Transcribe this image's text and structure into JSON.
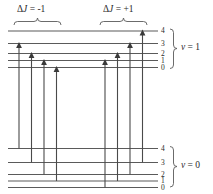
{
  "figure": {
    "background_color": "#ffffff",
    "line_color": "#5a5a5a",
    "text_color": "#2a2a2a",
    "width": 213,
    "height": 194
  },
  "branch_labels": {
    "left": {
      "delta": "Δ",
      "j": "J",
      "equals_value": " = -1",
      "full": "ΔJ = -1"
    },
    "right": {
      "delta": "Δ",
      "j": "J",
      "equals_value": " = +1",
      "full": "ΔJ = +1"
    }
  },
  "manifolds": [
    {
      "name": "upper",
      "v_symbol": "ν",
      "v_equals": " = 1",
      "v_full": "ν = 1",
      "j_labels": [
        "4",
        "3",
        "2",
        "1",
        "0"
      ],
      "level_y": [
        31,
        43.5,
        53.5,
        60.5,
        67.5
      ]
    },
    {
      "name": "lower",
      "v_symbol": "ν",
      "v_equals": " = 0",
      "v_full": "ν = 0",
      "j_labels": [
        "4",
        "3",
        "2",
        "1",
        "0"
      ],
      "level_y": [
        148.5,
        162.5,
        174.5,
        181,
        187.5
      ]
    }
  ],
  "transitions": {
    "left_branch": [
      {
        "x": 19,
        "from_level": "4",
        "to_level": "3",
        "y_start": 148.5,
        "y_end": 43.5
      },
      {
        "x": 31.5,
        "from_level": "3",
        "to_level": "2",
        "y_start": 162.5,
        "y_end": 53.5
      },
      {
        "x": 44,
        "from_level": "2",
        "to_level": "1",
        "y_start": 174.5,
        "y_end": 60.5
      },
      {
        "x": 56.5,
        "from_level": "1",
        "to_level": "0",
        "y_start": 181,
        "y_end": 67.5
      }
    ],
    "right_branch": [
      {
        "x": 105,
        "from_level": "0",
        "to_level": "1",
        "y_start": 187.5,
        "y_end": 60.5
      },
      {
        "x": 117.5,
        "from_level": "1",
        "to_level": "2",
        "y_start": 181,
        "y_end": 53.5
      },
      {
        "x": 130,
        "from_level": "2",
        "to_level": "3",
        "y_start": 174.5,
        "y_end": 43.5
      },
      {
        "x": 142.5,
        "from_level": "3",
        "to_level": "4",
        "y_start": 162.5,
        "y_end": 31
      }
    ]
  },
  "level_span": {
    "x_left": 8,
    "x_right": 158
  },
  "braces": {
    "left_branch": {
      "x_start": 14,
      "x_end": 62,
      "y": 22
    },
    "right_branch": {
      "x_start": 100,
      "x_end": 148,
      "y": 22
    },
    "upper_manifold": {
      "x": 176,
      "y_top": 29,
      "y_bottom": 69
    },
    "lower_manifold": {
      "x": 176,
      "y_top": 146,
      "y_bottom": 189
    }
  }
}
